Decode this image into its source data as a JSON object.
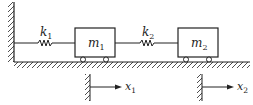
{
  "diagram": {
    "type": "two-mass spring system",
    "colors": {
      "stroke": "#222222",
      "background": "#ffffff"
    },
    "springs": [
      {
        "id": "k1",
        "label": "k",
        "subscript": "1"
      },
      {
        "id": "k2",
        "label": "k",
        "subscript": "2"
      }
    ],
    "masses": [
      {
        "id": "m1",
        "label": "m",
        "subscript": "1"
      },
      {
        "id": "m2",
        "label": "m",
        "subscript": "2"
      }
    ],
    "coordinates": [
      {
        "id": "x1",
        "label": "x",
        "subscript": "1"
      },
      {
        "id": "x2",
        "label": "x",
        "subscript": "2"
      }
    ]
  }
}
